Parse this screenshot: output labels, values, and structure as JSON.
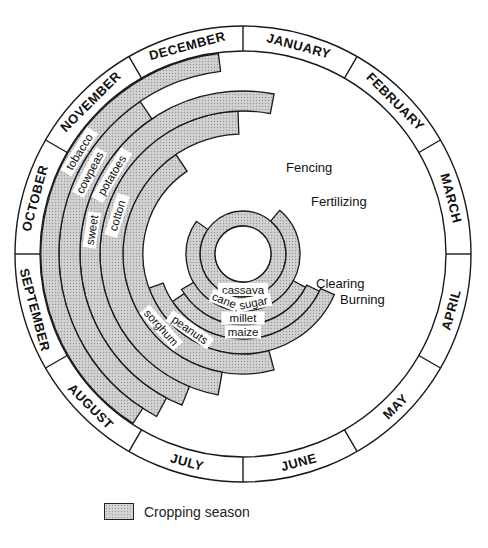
{
  "diagram": {
    "center": [
      243,
      254
    ],
    "month_ring": {
      "r_inner": 203,
      "r_outer": 228,
      "offset_deg": 0
    },
    "months": [
      "JANUARY",
      "FEBRUARY",
      "MARCH",
      "APRIL",
      "MAY",
      "JUNE",
      "JULY",
      "AUGUST",
      "SEPTEMBER",
      "OCTOBER",
      "NOVEMBER",
      "DECEMBER"
    ],
    "inner_circle_r": 28,
    "crops": [
      {
        "name": "cassava",
        "r0": 28,
        "r1": 43,
        "start": 0,
        "end": 360,
        "label_angle": 180
      },
      {
        "name": "sugar cane",
        "r0": 43,
        "r1": 57,
        "start": 40,
        "end": 305,
        "label_angle": 185,
        "label_parts": [
          "sugar",
          "cane"
        ]
      },
      {
        "name": "millet",
        "r0": 57,
        "r1": 71,
        "start": 118,
        "end": 240,
        "label_angle": 180
      },
      {
        "name": "maize",
        "r0": 71,
        "r1": 85,
        "start": 116,
        "end": 236,
        "label_angle": 180
      },
      {
        "name": "peanuts",
        "r0": 85,
        "r1": 100,
        "start": 114,
        "end": 250,
        "label_angle": 215
      },
      {
        "name": "sorghum",
        "r0": 100,
        "r1": 120,
        "start": 165,
        "end": 326,
        "label_angle": 228
      },
      {
        "name": "cotton",
        "r0": 120,
        "r1": 143,
        "start": 190,
        "end": 358,
        "label_angle": 287
      },
      {
        "name": "sweet potatoes",
        "r0": 143,
        "r1": 163,
        "start": 202,
        "end": 371,
        "label_angle": 290,
        "label_parts": [
          "sweet",
          "potatoes"
        ]
      },
      {
        "name": "cowpeas",
        "r0": 163,
        "r1": 184,
        "start": 208,
        "end": 326,
        "label_angle": 298
      },
      {
        "name": "tobacco",
        "r0": 184,
        "r1": 202,
        "start": 213,
        "end": 353,
        "label_angle": 302
      }
    ],
    "activities": [
      {
        "label": "Fencing",
        "x": 286,
        "y": 172
      },
      {
        "label": "Fertilizing",
        "x": 311,
        "y": 206
      },
      {
        "label": "Clearing",
        "x": 316,
        "y": 288
      },
      {
        "label": "Burning",
        "x": 340,
        "y": 304
      }
    ],
    "colors": {
      "stroke": "#1a1a1a",
      "fill": "#d2d2d2",
      "dot": "#9a9a9a",
      "background": "#ffffff"
    }
  },
  "legend": {
    "label": "Cropping season"
  }
}
